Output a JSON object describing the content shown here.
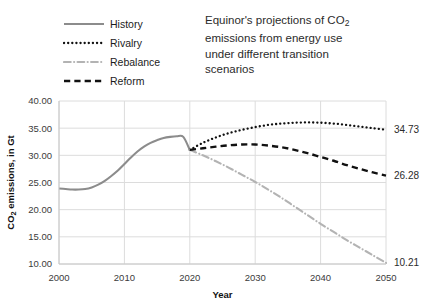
{
  "chart_data": {
    "type": "line",
    "title_lines": [
      "Equinor's projections of CO",
      "emissions from energy use",
      "under different transition",
      "scenarios"
    ],
    "title_subscript": "2",
    "xlabel": "Year",
    "ylabel": "CO2 emissions, in Gt",
    "ylabel_prefix": "CO",
    "ylabel_subscript": "2",
    "ylabel_suffix": " emissions, in Gt",
    "xlim": [
      2000,
      2050
    ],
    "ylim": [
      10,
      40
    ],
    "xticks": [
      2000,
      2010,
      2020,
      2030,
      2040,
      2050
    ],
    "xticklabels": [
      "2000",
      "2010",
      "2020",
      "2030",
      "2040",
      "2050"
    ],
    "yticks": [
      10,
      15,
      20,
      25,
      30,
      35,
      40
    ],
    "yticklabels": [
      "10.00",
      "15.00",
      "20.00",
      "25.00",
      "30.00",
      "35.00",
      "40.00"
    ],
    "grid": true,
    "legend_position": "top-left",
    "series": [
      {
        "name": "History",
        "style": "solid",
        "color": "#8c8c8c",
        "width": 2.1,
        "x": [
          2000,
          2001,
          2002,
          2003,
          2004,
          2005,
          2006,
          2007,
          2008,
          2009,
          2010,
          2011,
          2012,
          2013,
          2014,
          2015,
          2016,
          2017,
          2018,
          2019,
          2020
        ],
        "y": [
          23.9,
          23.8,
          23.7,
          23.7,
          23.8,
          24.1,
          24.6,
          25.3,
          26.2,
          27.2,
          28.4,
          29.6,
          30.7,
          31.6,
          32.3,
          32.8,
          33.2,
          33.4,
          33.5,
          33.4,
          31.0
        ]
      },
      {
        "name": "Rivalry",
        "style": "dotted",
        "color": "#111111",
        "width": 2.3,
        "x": [
          2020,
          2022,
          2024,
          2026,
          2028,
          2030,
          2032,
          2034,
          2036,
          2038,
          2040,
          2042,
          2044,
          2046,
          2048,
          2050
        ],
        "y": [
          31.0,
          32.3,
          33.3,
          34.1,
          34.7,
          35.2,
          35.6,
          35.85,
          36.0,
          36.05,
          36.0,
          35.85,
          35.6,
          35.3,
          35.0,
          34.73
        ],
        "end_label": "34.73"
      },
      {
        "name": "Rebalance",
        "style": "dashdot",
        "color": "#b3b3b3",
        "width": 2.1,
        "x": [
          2020,
          2022,
          2024,
          2026,
          2028,
          2030,
          2032,
          2034,
          2036,
          2038,
          2040,
          2042,
          2044,
          2046,
          2048,
          2050
        ],
        "y": [
          31.0,
          30.0,
          28.9,
          27.7,
          26.4,
          25.1,
          23.7,
          22.2,
          20.6,
          19.0,
          17.4,
          15.9,
          14.4,
          13.0,
          11.6,
          10.21
        ],
        "end_label": "10.21"
      },
      {
        "name": "Reform",
        "style": "dashed",
        "color": "#111111",
        "width": 2.4,
        "x": [
          2020,
          2022,
          2024,
          2026,
          2028,
          2030,
          2032,
          2034,
          2036,
          2038,
          2040,
          2042,
          2044,
          2046,
          2048,
          2050
        ],
        "y": [
          31.0,
          31.3,
          31.6,
          31.85,
          32.0,
          32.0,
          31.8,
          31.5,
          31.0,
          30.4,
          29.7,
          29.0,
          28.2,
          27.5,
          26.85,
          26.28
        ],
        "end_label": "26.28"
      }
    ],
    "legend": [
      {
        "label": "History",
        "style": "solid",
        "color": "#8c8c8c"
      },
      {
        "label": "Rivalry",
        "style": "dotted",
        "color": "#111111"
      },
      {
        "label": "Rebalance",
        "style": "dashdot",
        "color": "#b3b3b3"
      },
      {
        "label": "Reform",
        "style": "dashed",
        "color": "#111111"
      }
    ],
    "colors": {
      "grid": "#dcdcdc",
      "axis": "#c8c8c8",
      "text": "#3b3b3b",
      "background": "#ffffff"
    }
  }
}
